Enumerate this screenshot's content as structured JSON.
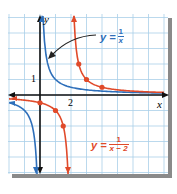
{
  "chart_data": {
    "type": "line",
    "title": "",
    "xlabel": "x",
    "ylabel": "y",
    "xlim": [
      -2,
      8
    ],
    "ylim": [
      -5,
      5
    ],
    "grid": true,
    "grid_step": 1,
    "tick_labels": {
      "x": [
        "2"
      ],
      "y": [
        "1"
      ]
    },
    "series": [
      {
        "name": "y = 1/x",
        "formula": "1/x",
        "color": "#2e6fba",
        "asymptote_x": 0,
        "points": []
      },
      {
        "name": "y = 1/(x − 2)",
        "formula": "1/(x-2)",
        "color": "#e04a2a",
        "asymptote_x": 2,
        "points": [
          [
            0,
            -0.5
          ],
          [
            1,
            -1
          ],
          [
            1.5,
            -2
          ],
          [
            2.5,
            2
          ],
          [
            3,
            1
          ],
          [
            4,
            0.5
          ]
        ]
      }
    ],
    "annotations": [
      {
        "text": "y = 1/x",
        "color": "#2e6fba",
        "arrow_to": [
          0.5,
          2
        ]
      },
      {
        "text": "y = 1/(x − 2)",
        "color": "#e04a2a"
      }
    ]
  },
  "labels": {
    "y_axis": "y",
    "x_axis": "x",
    "tick_x2": "2",
    "tick_y1": "1",
    "blue_eq_lhs": "y =",
    "blue_num": "1",
    "blue_den": "x",
    "red_eq_lhs": "y =",
    "red_num": "1",
    "red_den": "x − 2"
  },
  "colors": {
    "grid": "#a9cfe8",
    "axis": "#111111",
    "blue": "#2e6fba",
    "red": "#e04a2a",
    "shadow": "#8a8a8a"
  }
}
